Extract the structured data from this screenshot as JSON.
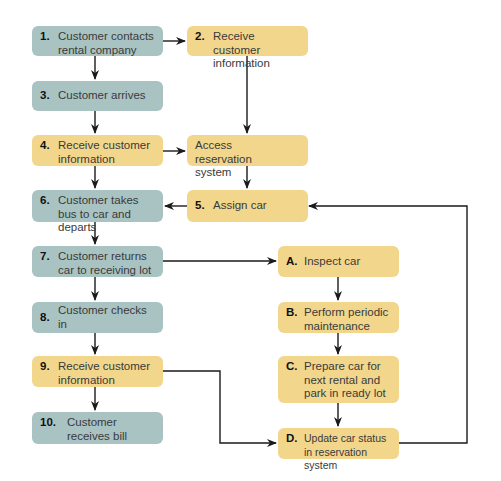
{
  "diagram": {
    "type": "flowchart",
    "colors": {
      "customer_step": "#a9c3c3",
      "company_step": "#f2d68c",
      "arrow": "#1a1a1a"
    },
    "nodes": {
      "n1": {
        "num": "1.",
        "text": "Customer contacts rental company"
      },
      "n2": {
        "num": "2.",
        "text": "Receive customer information"
      },
      "n3": {
        "num": "3.",
        "text": "Customer arrives"
      },
      "n4": {
        "num": "4.",
        "text": "Receive customer information"
      },
      "nAccess": {
        "num": "",
        "text": "Access reservation system"
      },
      "n5": {
        "num": "5.",
        "text": "Assign car"
      },
      "n6": {
        "num": "6.",
        "text": "Customer takes bus to car and departs"
      },
      "n7": {
        "num": "7.",
        "text": "Customer returns car to receiving lot"
      },
      "n8": {
        "num": "8.",
        "text": "Customer checks in"
      },
      "n9": {
        "num": "9.",
        "text": "Receive customer information"
      },
      "n10": {
        "num": "10.",
        "text": "Customer receives bill"
      },
      "nA": {
        "num": "A.",
        "text": "Inspect car"
      },
      "nB": {
        "num": "B.",
        "text": "Perform periodic maintenance"
      },
      "nC": {
        "num": "C.",
        "text": "Prepare car for next rental and park in ready lot"
      },
      "nD": {
        "num": "D.",
        "text": "Update car status in reservation system"
      }
    },
    "edges": [
      [
        "n1",
        "n2"
      ],
      [
        "n1",
        "n3"
      ],
      [
        "n2",
        "nAccess"
      ],
      [
        "n3",
        "n4"
      ],
      [
        "n4",
        "nAccess"
      ],
      [
        "n4",
        "n6"
      ],
      [
        "nAccess",
        "n5"
      ],
      [
        "n5",
        "n6"
      ],
      [
        "n6",
        "n7"
      ],
      [
        "n7",
        "nA"
      ],
      [
        "n7",
        "n8"
      ],
      [
        "n8",
        "n9"
      ],
      [
        "n9",
        "n10"
      ],
      [
        "n9",
        "nD"
      ],
      [
        "nA",
        "nB"
      ],
      [
        "nB",
        "nC"
      ],
      [
        "nC",
        "nD"
      ],
      [
        "nD",
        "n5"
      ]
    ]
  }
}
